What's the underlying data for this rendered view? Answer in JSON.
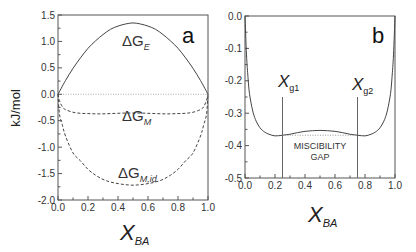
{
  "chart_data": [
    {
      "panel": "a",
      "type": "line",
      "panel_label": "a",
      "xlabel": "X",
      "xlabel_sub": "BA",
      "ylabel": "kJ/mol",
      "xlim": [
        0.0,
        1.0
      ],
      "ylim": [
        -2.0,
        1.5
      ],
      "xticks": [
        "0.0",
        "0.2",
        "0.4",
        "0.6",
        "0.8",
        "1.0"
      ],
      "yticks": [
        "1.5",
        "1.0",
        "0.5",
        "0.0",
        "-0.5",
        "-1.0",
        "-1.5",
        "-2.0"
      ],
      "ytick_values": [
        1.5,
        1.0,
        0.5,
        0.0,
        -0.5,
        -1.0,
        -1.5,
        -2.0
      ],
      "xtick_values": [
        0.0,
        0.2,
        0.4,
        0.6,
        0.8,
        1.0
      ],
      "zero_line": "dotted",
      "series": [
        {
          "name": "ΔG_E",
          "label_main": "ΔG",
          "label_sub": "E",
          "style": "solid",
          "x": [
            0.0,
            0.05,
            0.1,
            0.15,
            0.2,
            0.25,
            0.3,
            0.35,
            0.4,
            0.45,
            0.5,
            0.55,
            0.6,
            0.65,
            0.7,
            0.75,
            0.8,
            0.85,
            0.9,
            0.95,
            1.0
          ],
          "y": [
            0.0,
            0.26,
            0.49,
            0.69,
            0.87,
            1.01,
            1.13,
            1.23,
            1.29,
            1.33,
            1.35,
            1.33,
            1.29,
            1.23,
            1.13,
            1.01,
            0.87,
            0.69,
            0.49,
            0.26,
            0.0
          ]
        },
        {
          "name": "ΔG_M",
          "label_main": "ΔG",
          "label_sub": "M",
          "style": "dashed",
          "x": [
            0.0,
            0.01,
            0.03,
            0.05,
            0.1,
            0.15,
            0.2,
            0.25,
            0.3,
            0.35,
            0.4,
            0.45,
            0.5,
            0.55,
            0.6,
            0.65,
            0.7,
            0.75,
            0.8,
            0.85,
            0.9,
            0.95,
            0.97,
            0.99,
            1.0
          ],
          "y": [
            0.0,
            -0.12,
            -0.24,
            -0.29,
            -0.34,
            -0.36,
            -0.365,
            -0.37,
            -0.37,
            -0.365,
            -0.36,
            -0.355,
            -0.355,
            -0.355,
            -0.36,
            -0.365,
            -0.37,
            -0.37,
            -0.365,
            -0.36,
            -0.34,
            -0.29,
            -0.24,
            -0.12,
            0.0
          ]
        },
        {
          "name": "ΔG_M,id",
          "label_main": "ΔG",
          "label_sub": "M,id",
          "style": "dashed",
          "x": [
            0.0,
            0.01,
            0.03,
            0.05,
            0.1,
            0.15,
            0.2,
            0.25,
            0.3,
            0.35,
            0.4,
            0.45,
            0.5,
            0.55,
            0.6,
            0.65,
            0.7,
            0.75,
            0.8,
            0.85,
            0.9,
            0.95,
            0.97,
            0.99,
            1.0
          ],
          "y": [
            0.0,
            -0.38,
            -0.59,
            -0.79,
            -1.11,
            -1.26,
            -1.42,
            -1.53,
            -1.61,
            -1.66,
            -1.69,
            -1.71,
            -1.72,
            -1.71,
            -1.69,
            -1.66,
            -1.61,
            -1.53,
            -1.42,
            -1.26,
            -1.11,
            -0.79,
            -0.59,
            -0.38,
            0.0
          ]
        }
      ]
    },
    {
      "panel": "b",
      "type": "line",
      "panel_label": "b",
      "xlabel": "X",
      "xlabel_sub": "BA",
      "ylabel": "",
      "xlim": [
        0.0,
        1.0
      ],
      "ylim": [
        -0.5,
        0.0
      ],
      "xticks": [
        "0.0",
        "0.2",
        "0.4",
        "0.6",
        "0.8",
        "1.0"
      ],
      "xtick_values": [
        0.0,
        0.2,
        0.4,
        0.6,
        0.8,
        1.0
      ],
      "yticks": [
        "0.0",
        "-0.1",
        "-0.2",
        "-0.3",
        "-0.4",
        "-0.5"
      ],
      "ytick_values": [
        0.0,
        -0.1,
        -0.2,
        -0.3,
        -0.4,
        -0.5
      ],
      "series": [
        {
          "name": "ΔG_M",
          "style": "solid",
          "x": [
            0.0,
            0.01,
            0.02,
            0.03,
            0.05,
            0.07,
            0.1,
            0.13,
            0.16,
            0.2,
            0.25,
            0.3,
            0.35,
            0.4,
            0.45,
            0.5,
            0.55,
            0.6,
            0.65,
            0.7,
            0.75,
            0.8,
            0.84,
            0.87,
            0.9,
            0.93,
            0.95,
            0.97,
            0.98,
            0.99,
            1.0
          ],
          "y": [
            0.0,
            -0.12,
            -0.19,
            -0.24,
            -0.29,
            -0.32,
            -0.345,
            -0.358,
            -0.365,
            -0.37,
            -0.368,
            -0.365,
            -0.36,
            -0.356,
            -0.354,
            -0.353,
            -0.354,
            -0.356,
            -0.36,
            -0.365,
            -0.368,
            -0.37,
            -0.365,
            -0.358,
            -0.345,
            -0.32,
            -0.29,
            -0.24,
            -0.19,
            -0.12,
            0.0
          ]
        },
        {
          "name": "common tangent",
          "style": "dotted",
          "x": [
            0.25,
            0.75
          ],
          "y": [
            -0.368,
            -0.368
          ]
        }
      ],
      "annotations": [
        {
          "text": "X",
          "sub": "g1",
          "x": 0.25
        },
        {
          "text": "X",
          "sub": "g2",
          "x": 0.75
        },
        {
          "text": "MISCIBILITY",
          "line": 1
        },
        {
          "text": "GAP",
          "line": 2
        }
      ],
      "vertical_markers": [
        0.25,
        0.75
      ]
    }
  ]
}
